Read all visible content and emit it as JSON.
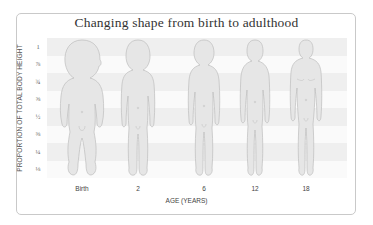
{
  "title": "Changing shape from birth to adulthood",
  "y_axis": {
    "label": "PROPORTION OF TOTAL BODY HEIGHT",
    "ticks": [
      "1",
      "⅞",
      "¾",
      "⅝",
      "½",
      "⅜",
      "¼",
      "⅛"
    ]
  },
  "x_axis": {
    "label": "AGE (YEARS)",
    "ticks": [
      "Birth",
      "2",
      "6",
      "12",
      "18"
    ]
  },
  "figures": [
    {
      "age": "Birth",
      "head_proportion": "1/4"
    },
    {
      "age": "2",
      "head_proportion": "1/5"
    },
    {
      "age": "6",
      "head_proportion": "1/6"
    },
    {
      "age": "12",
      "head_proportion": "1/7"
    },
    {
      "age": "18",
      "head_proportion": "1/8"
    }
  ],
  "colors": {
    "stripe_gray": "#efefef",
    "figure_fill": "#e6e6e6",
    "figure_outline": "#bdbdbd",
    "border": "#c9c9c9"
  }
}
